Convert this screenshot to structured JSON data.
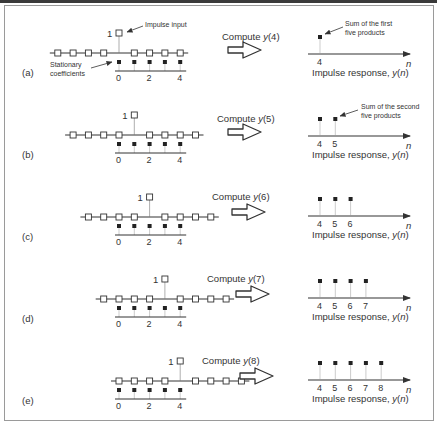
{
  "figure": {
    "panels": [
      {
        "label": "(a)",
        "shift": 0,
        "compute": "Compute ",
        "compute_var": "y",
        "compute_arg": "(4)",
        "outputs": [
          "4"
        ]
      },
      {
        "label": "(b)",
        "shift": 1,
        "compute": "Compute ",
        "compute_var": "y",
        "compute_arg": "(5)",
        "outputs": [
          "4",
          "5"
        ]
      },
      {
        "label": "(c)",
        "shift": 2,
        "compute": "Compute ",
        "compute_var": "y",
        "compute_arg": "(6)",
        "outputs": [
          "4",
          "5",
          "6"
        ]
      },
      {
        "label": "(d)",
        "shift": 3,
        "compute": "Compute ",
        "compute_var": "y",
        "compute_arg": "(7)",
        "outputs": [
          "4",
          "5",
          "6",
          "7"
        ]
      },
      {
        "label": "(e)",
        "shift": 4,
        "compute": "Compute ",
        "compute_var": "y",
        "compute_arg": "(8)",
        "outputs": [
          "4",
          "5",
          "6",
          "7",
          "8"
        ]
      }
    ],
    "impulse_value_label": "1",
    "coefficient_ticks": [
      "0",
      "2",
      "4"
    ],
    "axis_var": "n",
    "response_label_prefix": "Impulse response, ",
    "response_label_var": "y",
    "response_label_arg_open": "(",
    "response_label_arg": "n",
    "response_label_arg_close": ")",
    "annotations": {
      "impulse_input": "Impulse input",
      "stationary_coefficients_line1": "Stationary",
      "stationary_coefficients_line2": "coefficients",
      "sum_first_line1": "Sum of the first",
      "sum_first_line2": "five products",
      "sum_second_line1": "Sum of the second",
      "sum_second_line2": "five products"
    }
  }
}
